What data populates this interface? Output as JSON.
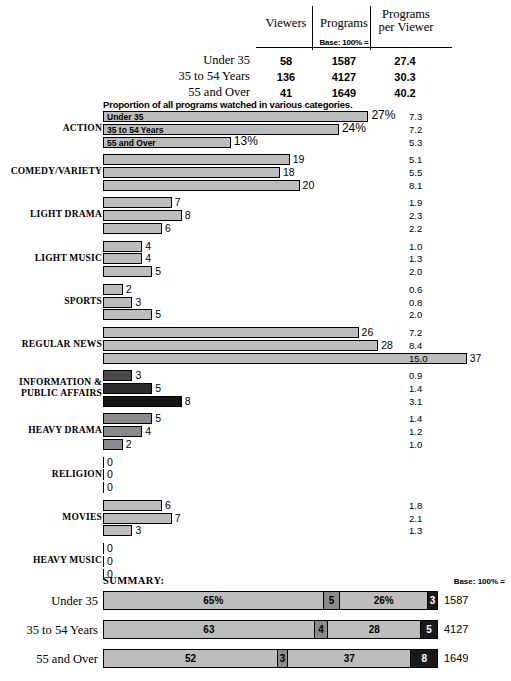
{
  "header": {
    "columns": [
      "Viewers",
      "Programs",
      "Programs per Viewer"
    ],
    "col_viewers": "Viewers",
    "col_programs": "Programs",
    "col_ppv_line1": "Programs",
    "col_ppv_line2": "per Viewer",
    "base_note": "Base: 100% =",
    "rows": [
      {
        "label": "Under 35",
        "viewers": "58",
        "programs": "1587",
        "ppv": "27.4"
      },
      {
        "label": "35 to 54 Years",
        "viewers": "136",
        "programs": "4127",
        "ppv": "30.3"
      },
      {
        "label": "55 and Over",
        "viewers": "41",
        "programs": "1649",
        "ppv": "40.2"
      }
    ]
  },
  "chart_note": "Proportion of all programs watched in various categories.",
  "groups": [
    {
      "name": "ACTION",
      "in_bar_labels": [
        "Under 35",
        "35 to 54 Years",
        "55 and Over"
      ],
      "bars": [
        {
          "value": 27,
          "label": "27%",
          "shade": "lt"
        },
        {
          "value": 24,
          "label": "24%",
          "shade": "lt"
        },
        {
          "value": 13,
          "label": "13%",
          "shade": "lt"
        }
      ],
      "ppv": [
        "7.3",
        "7.2",
        "5.3"
      ]
    },
    {
      "name": "COMEDY/VARIETY",
      "bars": [
        {
          "value": 19,
          "label": "19",
          "shade": "lt"
        },
        {
          "value": 18,
          "label": "18",
          "shade": "lt"
        },
        {
          "value": 20,
          "label": "20",
          "shade": "lt"
        }
      ],
      "ppv": [
        "5.1",
        "5.5",
        "8.1"
      ]
    },
    {
      "name": "LIGHT DRAMA",
      "bars": [
        {
          "value": 7,
          "label": "7",
          "shade": "lt"
        },
        {
          "value": 8,
          "label": "8",
          "shade": "lt"
        },
        {
          "value": 6,
          "label": "6",
          "shade": "lt"
        }
      ],
      "ppv": [
        "1.9",
        "2.3",
        "2.2"
      ]
    },
    {
      "name": "LIGHT MUSIC",
      "bars": [
        {
          "value": 4,
          "label": "4",
          "shade": "lt"
        },
        {
          "value": 4,
          "label": "4",
          "shade": "lt"
        },
        {
          "value": 5,
          "label": "5",
          "shade": "lt"
        }
      ],
      "ppv": [
        "1.0",
        "1.3",
        "2.0"
      ]
    },
    {
      "name": "SPORTS",
      "bars": [
        {
          "value": 2,
          "label": "2",
          "shade": "lt"
        },
        {
          "value": 3,
          "label": "3",
          "shade": "lt"
        },
        {
          "value": 5,
          "label": "5",
          "shade": "lt"
        }
      ],
      "ppv": [
        "0.6",
        "0.8",
        "2.0"
      ]
    },
    {
      "name": "REGULAR NEWS",
      "bars": [
        {
          "value": 26,
          "label": "26",
          "shade": "lt"
        },
        {
          "value": 28,
          "label": "28",
          "shade": "lt"
        },
        {
          "value": 37,
          "label": "37",
          "shade": "lt"
        }
      ],
      "ppv": [
        "7.2",
        "8.4",
        "15.0"
      ]
    },
    {
      "name": "INFORMATION & PUBLIC AFFAIRS",
      "name_line1": "INFORMATION &",
      "name_line2": "PUBLIC AFFAIRS",
      "bars": [
        {
          "value": 3,
          "label": "3",
          "shade": "dk"
        },
        {
          "value": 5,
          "label": "5",
          "shade": "dkr"
        },
        {
          "value": 8,
          "label": "8",
          "shade": "vdk"
        }
      ],
      "ppv": [
        "0.9",
        "1.4",
        "3.1"
      ]
    },
    {
      "name": "HEAVY DRAMA",
      "bars": [
        {
          "value": 5,
          "label": "5",
          "shade": "md"
        },
        {
          "value": 4,
          "label": "4",
          "shade": "md"
        },
        {
          "value": 2,
          "label": "2",
          "shade": "md"
        }
      ],
      "ppv": [
        "1.4",
        "1.2",
        "1.0"
      ]
    },
    {
      "name": "RELIGION",
      "bars": [
        {
          "value": 0,
          "label": "0",
          "shade": "lt"
        },
        {
          "value": 0,
          "label": "0",
          "shade": "lt"
        },
        {
          "value": 0,
          "label": "0",
          "shade": "lt"
        }
      ],
      "ppv": [
        "",
        "",
        ""
      ]
    },
    {
      "name": "MOVIES",
      "bars": [
        {
          "value": 6,
          "label": "6",
          "shade": "lt"
        },
        {
          "value": 7,
          "label": "7",
          "shade": "lt"
        },
        {
          "value": 3,
          "label": "3",
          "shade": "lt"
        }
      ],
      "ppv": [
        "1.8",
        "2.1",
        "1.3"
      ]
    },
    {
      "name": "HEAVY MUSIC",
      "bars": [
        {
          "value": 0,
          "label": "0",
          "shade": "lt"
        },
        {
          "value": 0,
          "label": "0",
          "shade": "lt"
        },
        {
          "value": 0,
          "label": "0",
          "shade": "lt"
        }
      ],
      "ppv": [
        "",
        "",
        ""
      ]
    }
  ],
  "summary": {
    "title": "SUMMARY:",
    "base_note": "Base: 100% =",
    "rows": [
      {
        "label": "Under 35",
        "segments": [
          {
            "value": 65,
            "label": "65%"
          },
          {
            "value": 5,
            "label": "5"
          },
          {
            "value": 26,
            "label": "26%"
          },
          {
            "value": 3,
            "label": "3"
          }
        ],
        "total": "1587"
      },
      {
        "label": "35 to 54 Years",
        "segments": [
          {
            "value": 63,
            "label": "63"
          },
          {
            "value": 4,
            "label": "4"
          },
          {
            "value": 28,
            "label": "28"
          },
          {
            "value": 5,
            "label": "5"
          }
        ],
        "total": "4127"
      },
      {
        "label": "55 and Over",
        "segments": [
          {
            "value": 52,
            "label": "52"
          },
          {
            "value": 3,
            "label": "3"
          },
          {
            "value": 37,
            "label": "37"
          },
          {
            "value": 8,
            "label": "8"
          }
        ],
        "total": "1649"
      }
    ]
  },
  "chart_data": {
    "type": "bar",
    "title": "Proportion of all programs watched in various categories.",
    "orientation": "horizontal",
    "xlabel": "",
    "ylabel": "",
    "unit": "percent",
    "categories": [
      "ACTION",
      "COMEDY/VARIETY",
      "LIGHT DRAMA",
      "LIGHT MUSIC",
      "SPORTS",
      "REGULAR NEWS",
      "INFORMATION & PUBLIC AFFAIRS",
      "HEAVY DRAMA",
      "RELIGION",
      "MOVIES",
      "HEAVY MUSIC"
    ],
    "series": [
      {
        "name": "Under 35",
        "values": [
          27,
          19,
          7,
          4,
          2,
          26,
          3,
          5,
          0,
          6,
          0
        ]
      },
      {
        "name": "35 to 54 Years",
        "values": [
          24,
          18,
          8,
          4,
          3,
          28,
          5,
          4,
          0,
          7,
          0
        ]
      },
      {
        "name": "55 and Over",
        "values": [
          13,
          20,
          6,
          5,
          5,
          37,
          8,
          2,
          0,
          3,
          0
        ]
      }
    ],
    "programs_per_viewer": {
      "Under 35": [
        7.3,
        5.1,
        1.9,
        1.0,
        0.6,
        7.2,
        0.9,
        1.4,
        null,
        1.8,
        null
      ],
      "35 to 54 Years": [
        7.2,
        5.5,
        2.3,
        1.3,
        0.8,
        8.4,
        1.4,
        1.2,
        null,
        2.1,
        null
      ],
      "55 and Over": [
        5.3,
        8.1,
        2.2,
        2.0,
        2.0,
        15.0,
        3.1,
        1.0,
        null,
        1.3,
        null
      ]
    },
    "table": {
      "columns": [
        "",
        "Viewers",
        "Programs",
        "Programs per Viewer"
      ],
      "rows": [
        [
          "Under 35",
          58,
          1587,
          27.4
        ],
        [
          "35 to 54 Years",
          136,
          4127,
          30.3
        ],
        [
          "55 and Over",
          41,
          1649,
          40.2
        ]
      ]
    },
    "summary_stacked": {
      "type": "bar",
      "stacked": true,
      "categories": [
        "Under 35",
        "35 to 54 Years",
        "55 and Over"
      ],
      "series": [
        {
          "name": "segment 1",
          "values": [
            65,
            63,
            52
          ]
        },
        {
          "name": "segment 2",
          "values": [
            5,
            4,
            3
          ]
        },
        {
          "name": "segment 3",
          "values": [
            26,
            28,
            37
          ]
        },
        {
          "name": "segment 4",
          "values": [
            3,
            5,
            8
          ]
        }
      ],
      "totals": [
        1587,
        4127,
        1649
      ]
    }
  }
}
